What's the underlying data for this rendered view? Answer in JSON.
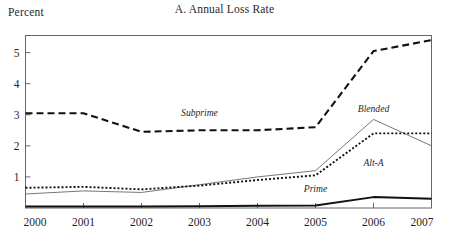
{
  "figure": {
    "title": "A. Annual Loss Rate",
    "y_axis_caption": "Percent"
  },
  "chart_data": {
    "type": "line",
    "title": "A. Annual Loss Rate",
    "subtitle": "",
    "xlabel": "",
    "ylabel": "Percent",
    "x": [
      "2000",
      "2001",
      "2002",
      "2003",
      "2004",
      "2005",
      "2006",
      "2007"
    ],
    "categories": [
      "2000",
      "2001",
      "2002",
      "2003",
      "2004",
      "2005",
      "2006",
      "2007"
    ],
    "xtick_labels": [
      "2000",
      "2001",
      "2002",
      "2003",
      "2004",
      "2005",
      "2006",
      "2007"
    ],
    "ytick_labels": [
      "1",
      "2",
      "3",
      "4",
      "5"
    ],
    "yticks": [
      1,
      2,
      3,
      4,
      5
    ],
    "ylim": [
      0,
      5.55
    ],
    "xlim": [
      2000,
      2007
    ],
    "grid": false,
    "legend_position": "inline-annotations",
    "series": [
      {
        "name": "Subprime",
        "style": "dashed",
        "color": "#111111",
        "width": 2.1,
        "values": [
          3.05,
          3.05,
          2.45,
          2.5,
          2.5,
          2.6,
          5.05,
          5.4
        ],
        "label_x": "2003",
        "label_value": 2.95
      },
      {
        "name": "Blended",
        "style": "solid-thin",
        "color": "#777777",
        "width": 1.0,
        "values": [
          0.45,
          0.55,
          0.5,
          0.75,
          1.0,
          1.2,
          2.85,
          2.0
        ],
        "label_x": "2006",
        "label_value": 3.1
      },
      {
        "name": "Alt-A",
        "style": "dotted",
        "color": "#111111",
        "width": 1.9,
        "values": [
          0.65,
          0.68,
          0.6,
          0.72,
          0.9,
          1.05,
          2.4,
          2.4
        ],
        "label_x": "2006",
        "label_value": 1.35
      },
      {
        "name": "Prime",
        "style": "solid-thick",
        "color": "#111111",
        "width": 2.0,
        "values": [
          0.05,
          0.05,
          0.05,
          0.06,
          0.07,
          0.08,
          0.35,
          0.3
        ],
        "label_x": "2005",
        "label_value": 0.5
      }
    ]
  }
}
